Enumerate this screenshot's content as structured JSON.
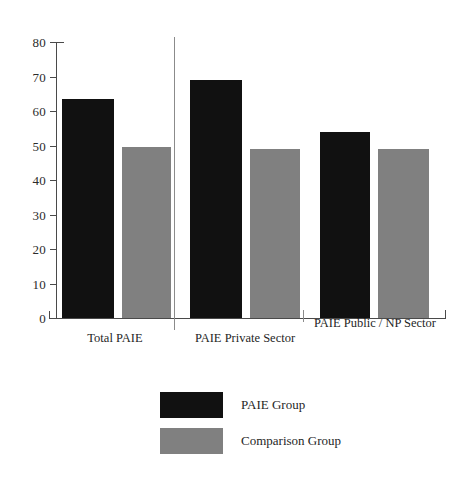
{
  "chart_data": {
    "type": "bar",
    "title": "",
    "subtitle": "",
    "xlabel": "",
    "ylabel": "",
    "ylim": [
      0,
      80
    ],
    "ytick_labels": [
      "80",
      "70",
      "60",
      "50",
      "40",
      "30",
      "20",
      "10",
      "0"
    ],
    "ytick_values": [
      80,
      70,
      60,
      50,
      40,
      30,
      20,
      10,
      0
    ],
    "grid": false,
    "legend_position": "bottom-center",
    "categories": [
      "Total PAIE",
      "PAIE Private Sector",
      "PAIE Public / NP Sector"
    ],
    "series": [
      {
        "name": "PAIE Group",
        "color": "#111111",
        "values": [
          63.5,
          69,
          54
        ]
      },
      {
        "name": "Comparison Group",
        "color": "#808080",
        "values": [
          49.5,
          49,
          49
        ]
      }
    ]
  },
  "axis": {
    "y_ticks": [
      {
        "label": "80",
        "value": 80
      },
      {
        "label": "70",
        "value": 70
      },
      {
        "label": "60",
        "value": 60
      },
      {
        "label": "50",
        "value": 50
      },
      {
        "label": "40",
        "value": 40
      },
      {
        "label": "30",
        "value": 30
      },
      {
        "label": "20",
        "value": 20
      },
      {
        "label": "10",
        "value": 10
      },
      {
        "label": "0",
        "value": 0
      }
    ]
  },
  "categories": [
    {
      "label": "Total PAIE"
    },
    {
      "label": "PAIE Private Sector"
    },
    {
      "label": "PAIE Public / NP Sector"
    }
  ],
  "legend": {
    "items": [
      {
        "label": "PAIE Group",
        "color": "#111111"
      },
      {
        "label": "Comparison Group",
        "color": "#808080"
      }
    ]
  }
}
